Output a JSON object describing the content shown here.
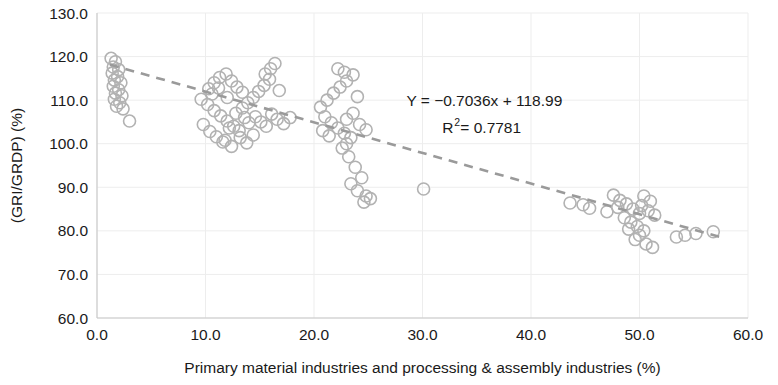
{
  "chart_data": {
    "type": "scatter",
    "title": "",
    "xlabel": "Primary material industries and processing & assembly industries (%)",
    "ylabel": "(GRI/GRDP) (%)",
    "xlim": [
      0.0,
      60.0
    ],
    "ylim": [
      60.0,
      130.0
    ],
    "xticks": [
      "0.0",
      "10.0",
      "20.0",
      "30.0",
      "40.0",
      "50.0",
      "60.0"
    ],
    "yticks": [
      "60.0",
      "70.0",
      "80.0",
      "90.0",
      "100.0",
      "110.0",
      "120.0",
      "130.0"
    ],
    "xtick_values": [
      0,
      10,
      20,
      30,
      40,
      50,
      60
    ],
    "ytick_values": [
      60,
      70,
      80,
      90,
      100,
      110,
      120,
      130
    ],
    "grid": true,
    "legend": "none",
    "marker_style": "open-circle",
    "marker_color": "#b2b2b2",
    "trendline_color": "#9a9a9a",
    "trendline_style": "dashed",
    "annotations": {
      "equation": "Y = −0.7036x + 118.99",
      "r_squared_base": "R",
      "r_squared_exp": "2",
      "r_squared_value": " = 0.7781"
    },
    "fit": {
      "slope": -0.7036,
      "intercept": 118.99,
      "r2": 0.7781
    },
    "trendline_endpoints": {
      "x1": 1.2,
      "y1": 118.15,
      "x2": 57.5,
      "y2": 78.52
    },
    "points": [
      [
        1.3,
        119.6
      ],
      [
        1.7,
        118.8
      ],
      [
        1.5,
        117.6
      ],
      [
        2.0,
        117.0
      ],
      [
        1.4,
        116.2
      ],
      [
        1.9,
        115.4
      ],
      [
        1.6,
        114.6
      ],
      [
        2.2,
        114.0
      ],
      [
        1.5,
        113.2
      ],
      [
        2.0,
        112.4
      ],
      [
        1.7,
        111.6
      ],
      [
        2.3,
        111.0
      ],
      [
        1.6,
        110.2
      ],
      [
        2.1,
        109.4
      ],
      [
        1.8,
        108.6
      ],
      [
        2.4,
        108.0
      ],
      [
        3.0,
        105.2
      ],
      [
        9.6,
        110.2
      ],
      [
        10.3,
        112.6
      ],
      [
        10.8,
        114.0
      ],
      [
        11.3,
        115.2
      ],
      [
        11.9,
        116.0
      ],
      [
        12.4,
        114.4
      ],
      [
        12.9,
        113.0
      ],
      [
        13.4,
        111.8
      ],
      [
        10.2,
        109.0
      ],
      [
        10.8,
        107.6
      ],
      [
        11.4,
        106.4
      ],
      [
        12.0,
        105.2
      ],
      [
        12.6,
        104.0
      ],
      [
        13.1,
        103.0
      ],
      [
        9.8,
        104.4
      ],
      [
        10.4,
        102.8
      ],
      [
        11.0,
        101.6
      ],
      [
        11.6,
        100.4
      ],
      [
        12.2,
        103.6
      ],
      [
        12.8,
        107.0
      ],
      [
        13.4,
        108.2
      ],
      [
        13.9,
        109.4
      ],
      [
        14.4,
        110.6
      ],
      [
        14.9,
        112.0
      ],
      [
        15.4,
        113.4
      ],
      [
        15.9,
        114.8
      ],
      [
        16.4,
        118.4
      ],
      [
        16.0,
        117.2
      ],
      [
        15.5,
        116.0
      ],
      [
        14.6,
        106.2
      ],
      [
        15.1,
        105.0
      ],
      [
        15.6,
        104.0
      ],
      [
        16.1,
        106.8
      ],
      [
        16.6,
        105.6
      ],
      [
        17.2,
        104.6
      ],
      [
        17.8,
        106.0
      ],
      [
        13.2,
        101.4
      ],
      [
        13.8,
        100.2
      ],
      [
        14.4,
        102.0
      ],
      [
        12.4,
        99.4
      ],
      [
        11.8,
        100.8
      ],
      [
        10.6,
        111.4
      ],
      [
        11.2,
        112.8
      ],
      [
        14.0,
        104.8
      ],
      [
        16.8,
        112.2
      ],
      [
        12.0,
        110.6
      ],
      [
        13.6,
        106.0
      ],
      [
        20.6,
        108.4
      ],
      [
        21.2,
        110.0
      ],
      [
        21.8,
        111.6
      ],
      [
        22.4,
        113.0
      ],
      [
        23.0,
        114.4
      ],
      [
        23.6,
        115.8
      ],
      [
        22.2,
        117.2
      ],
      [
        22.8,
        116.4
      ],
      [
        21.0,
        106.2
      ],
      [
        21.6,
        104.8
      ],
      [
        22.2,
        103.6
      ],
      [
        22.8,
        102.4
      ],
      [
        23.4,
        101.4
      ],
      [
        20.8,
        103.0
      ],
      [
        21.4,
        101.8
      ],
      [
        23.0,
        105.6
      ],
      [
        23.6,
        107.0
      ],
      [
        24.2,
        104.4
      ],
      [
        24.8,
        103.2
      ],
      [
        24.0,
        110.8
      ],
      [
        23.2,
        97.0
      ],
      [
        23.8,
        94.6
      ],
      [
        24.4,
        92.2
      ],
      [
        23.4,
        90.8
      ],
      [
        24.0,
        89.2
      ],
      [
        24.8,
        88.0
      ],
      [
        25.2,
        87.4
      ],
      [
        24.6,
        86.6
      ],
      [
        22.6,
        99.0
      ],
      [
        23.0,
        100.0
      ],
      [
        30.1,
        89.6
      ],
      [
        43.6,
        86.4
      ],
      [
        44.8,
        86.0
      ],
      [
        45.4,
        85.2
      ],
      [
        47.6,
        88.2
      ],
      [
        48.2,
        87.0
      ],
      [
        48.8,
        86.2
      ],
      [
        49.4,
        85.0
      ],
      [
        50.0,
        84.0
      ],
      [
        48.6,
        83.0
      ],
      [
        49.2,
        82.0
      ],
      [
        49.8,
        81.0
      ],
      [
        50.4,
        80.0
      ],
      [
        50.0,
        79.0
      ],
      [
        49.6,
        78.0
      ],
      [
        50.6,
        77.0
      ],
      [
        51.2,
        76.2
      ],
      [
        50.2,
        85.8
      ],
      [
        50.8,
        84.6
      ],
      [
        51.4,
        83.6
      ],
      [
        49.0,
        80.4
      ],
      [
        53.4,
        78.6
      ],
      [
        54.2,
        79.0
      ],
      [
        55.2,
        79.4
      ],
      [
        56.8,
        79.8
      ],
      [
        47.0,
        84.4
      ],
      [
        48.0,
        85.4
      ],
      [
        51.0,
        86.8
      ],
      [
        50.4,
        88.0
      ]
    ]
  },
  "annotation_position": {
    "x": 0.595,
    "y_eq": 0.305,
    "y_r2": 0.395
  }
}
